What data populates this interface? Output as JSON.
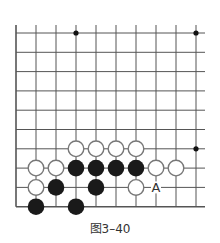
{
  "figure": {
    "caption": "图3–40",
    "line_color": "#555555",
    "black_stone_color": "#1a1a1a",
    "white_stone_fill": "#ffffff",
    "white_stone_stroke": "#777777"
  },
  "board": {
    "columns": 10,
    "rows": 10,
    "origin_x": 16,
    "origin_y": 33,
    "spacing_x": 20,
    "spacing_y": 19.3,
    "right_extent_x": 205,
    "top_extent_y": 25,
    "edges": [
      "left",
      "bottom"
    ],
    "star_points": [
      {
        "col": 3,
        "row": 0
      },
      {
        "col": 9,
        "row": 0
      },
      {
        "col": 9,
        "row": 6
      }
    ],
    "stones": [
      {
        "color": "white",
        "col": 3,
        "row": 6
      },
      {
        "color": "white",
        "col": 4,
        "row": 6
      },
      {
        "color": "white",
        "col": 5,
        "row": 6
      },
      {
        "color": "white",
        "col": 6,
        "row": 6
      },
      {
        "color": "white",
        "col": 1,
        "row": 7
      },
      {
        "color": "white",
        "col": 2,
        "row": 7
      },
      {
        "color": "black",
        "col": 3,
        "row": 7
      },
      {
        "color": "black",
        "col": 4,
        "row": 7
      },
      {
        "color": "black",
        "col": 5,
        "row": 7
      },
      {
        "color": "black",
        "col": 6,
        "row": 7
      },
      {
        "color": "white",
        "col": 7,
        "row": 7
      },
      {
        "color": "white",
        "col": 8,
        "row": 7
      },
      {
        "color": "white",
        "col": 1,
        "row": 8
      },
      {
        "color": "black",
        "col": 2,
        "row": 8
      },
      {
        "color": "black",
        "col": 4,
        "row": 8
      },
      {
        "color": "white",
        "col": 6,
        "row": 8
      },
      {
        "color": "black",
        "col": 1,
        "row": 9
      },
      {
        "color": "black",
        "col": 3,
        "row": 9
      }
    ],
    "labels": [
      {
        "text": "A",
        "col": 7,
        "row": 8
      }
    ]
  }
}
